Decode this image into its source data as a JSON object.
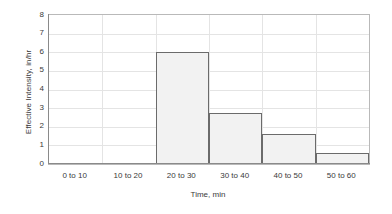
{
  "chart_data": {
    "type": "bar",
    "title": "",
    "subtitle": "",
    "xlabel": "Time, min",
    "ylabel": "Effective Intensity, in/hr",
    "categories": [
      "0 to 10",
      "10 to 20",
      "20 to 30",
      "30 to 40",
      "40 to 50",
      "50 to 60"
    ],
    "values": [
      0,
      0,
      6.0,
      2.75,
      1.6,
      0.6
    ],
    "series": [
      {
        "name": "Effective Intensity",
        "values": [
          0,
          0,
          6.0,
          2.75,
          1.6,
          0.6
        ]
      }
    ],
    "ylim": [
      0,
      8
    ],
    "yticks": [
      0,
      1,
      2,
      3,
      4,
      5,
      6,
      7,
      8
    ],
    "ytick_labels": [
      "0",
      "1",
      "2",
      "3",
      "4",
      "5",
      "6",
      "7",
      "8"
    ],
    "grid": true,
    "grid_axis": "both",
    "legend": false,
    "legend_position": "none",
    "bar_style": "histogram-contiguous",
    "annotations": []
  },
  "colors": {
    "bar_fill": "#f2f2f2",
    "bar_border": "#6b6b6b",
    "gridline": "#e4e4e4",
    "axis_line": "#8a8a8a",
    "plot_border": "#b9b9b9",
    "text": "#3a3a3a",
    "background": "#ffffff"
  }
}
